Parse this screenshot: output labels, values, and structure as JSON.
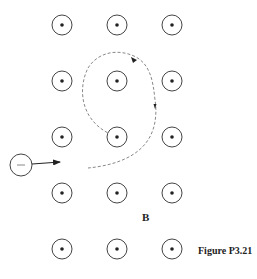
{
  "figure": {
    "caption": "Figure P3.21",
    "field_label": "B",
    "field_symbol": "dot-in-circle (field out of page)",
    "grid": {
      "rows_y": [
        25,
        81,
        137,
        193,
        249
      ],
      "cols_x": [
        62,
        117,
        172
      ],
      "ring_radius": 10
    },
    "particle": {
      "symbol": "−",
      "cx": 21,
      "cy": 165,
      "r": 11
    }
  }
}
